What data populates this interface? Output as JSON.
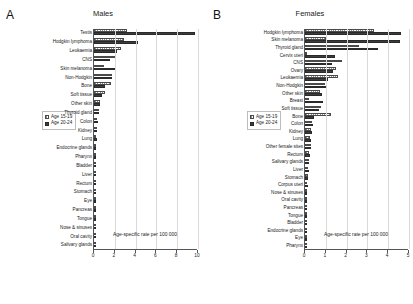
{
  "figure": {
    "panels": [
      {
        "letter": "A",
        "title": "Males",
        "xlabel": "Age-specific rate per 100 000",
        "xticks": [
          "0",
          "2",
          "4",
          "6",
          "8",
          "10"
        ],
        "legend": [
          "Age 15-19",
          "Age 20-24"
        ]
      },
      {
        "letter": "B",
        "title": "Females",
        "xlabel": "Age-specific rate per 100 000",
        "xticks": [
          "0",
          "1",
          "2",
          "3",
          "4",
          "5"
        ],
        "legend": [
          "Age 15-19",
          "Age 20-24"
        ]
      }
    ]
  },
  "chart_data": [
    {
      "type": "bar",
      "title": "Males",
      "panel": "A",
      "orientation": "horizontal",
      "xlabel": "Age-specific rate per 100 000",
      "ylabel": "",
      "xlim": [
        0,
        10
      ],
      "xticks": [
        0,
        2,
        4,
        6,
        8,
        10
      ],
      "grid": "vertical",
      "legend_position": "center-right",
      "categories": [
        "Testis",
        "Hodgkin lymphoma",
        "Leukaemia",
        "CNS",
        "Skin melanoma",
        "Non-Hodgkin",
        "Bone",
        "Soft tissue",
        "Other skin",
        "Thyroid gland",
        "Colon",
        "Kidney",
        "Lung",
        "Endocrine glands",
        "Pharynx",
        "Bladder",
        "Liver",
        "Rectum",
        "Stomach",
        "Eye",
        "Pancreas",
        "Tongue",
        "Nose & sinuses",
        "Oral cavity",
        "Salivary glands"
      ],
      "series": [
        {
          "name": "Age 15-19",
          "values": [
            3.2,
            2.9,
            2.55,
            2.1,
            0.95,
            1.75,
            1.6,
            1.05,
            0.62,
            0.5,
            0.32,
            0.26,
            0.24,
            0.23,
            0.2,
            0.19,
            0.18,
            0.17,
            0.16,
            0.1,
            0.09,
            0.09,
            0.08,
            0.07,
            0.06
          ]
        },
        {
          "name": "Age 20-24",
          "values": [
            9.7,
            4.2,
            2.2,
            1.5,
            2.0,
            1.7,
            1.05,
            0.78,
            0.55,
            0.52,
            0.36,
            0.3,
            0.26,
            0.2,
            0.2,
            0.22,
            0.2,
            0.2,
            0.2,
            0.1,
            0.1,
            0.1,
            0.07,
            0.07,
            0.06
          ]
        }
      ]
    },
    {
      "type": "bar",
      "title": "Females",
      "panel": "B",
      "orientation": "horizontal",
      "xlabel": "Age-specific rate per 100 000",
      "ylabel": "",
      "xlim": [
        0,
        5
      ],
      "xticks": [
        0,
        1,
        2,
        3,
        4,
        5
      ],
      "grid": "vertical",
      "legend_position": "center-right",
      "categories": [
        "Hodgkin lymphoma",
        "Skin melanoma",
        "Thyroid gland",
        "Cervix uteri",
        "CNS",
        "Ovary",
        "Leukaemia",
        "Non-Hodgkin",
        "Other skin",
        "Breast",
        "Soft tissue",
        "Bone",
        "Colon",
        "Kidney",
        "Lung",
        "Other female sites",
        "Rectum",
        "Salivary glands",
        "Liver",
        "Stomach",
        "Corpus uteri",
        "Nose & sinuses",
        "Oral cavity",
        "Pancreas",
        "Tongue",
        "Bladder",
        "Endocrine glands",
        "Eye",
        "Pharynx"
      ],
      "series": [
        {
          "name": "Age 15-19",
          "values": [
            3.3,
            1.0,
            2.6,
            0.1,
            1.8,
            1.5,
            1.6,
            0.95,
            0.72,
            0.18,
            0.78,
            1.25,
            0.35,
            0.3,
            0.25,
            0.28,
            0.18,
            0.2,
            0.14,
            0.13,
            0.11,
            0.1,
            0.09,
            0.09,
            0.08,
            0.08,
            0.09,
            0.07,
            0.05
          ]
        },
        {
          "name": "Age 20-24",
          "values": [
            4.6,
            4.55,
            3.5,
            1.45,
            1.3,
            1.35,
            1.1,
            1.0,
            0.8,
            0.85,
            0.65,
            0.45,
            0.4,
            0.32,
            0.3,
            0.3,
            0.22,
            0.18,
            0.17,
            0.15,
            0.15,
            0.1,
            0.1,
            0.1,
            0.08,
            0.1,
            0.1,
            0.07,
            0.05
          ]
        }
      ]
    }
  ]
}
